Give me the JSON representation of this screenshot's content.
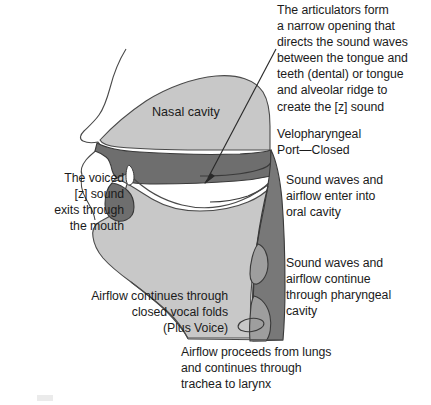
{
  "figure": {
    "background_color": "#ffffff",
    "text_color": "#1b1b1b"
  },
  "colors": {
    "light_gray": "#c8c8c8",
    "mid_gray": "#9e9e9e",
    "dark_gray": "#6e6e6e",
    "pharynx_gray": "#787878",
    "outline": "#3a3a3a",
    "white": "#ffffff"
  },
  "labels": {
    "nasal_cavity": "Nasal cavity"
  },
  "annotations": [
    {
      "id": "articulators",
      "text": "The articulators form\na narrow opening that\ndirects the sound waves\nbetween the tongue and\nteeth (dental) or tongue\nand alveolar ridge to\ncreate the [z] sound",
      "align": "left"
    },
    {
      "id": "velopharyngeal",
      "text": "Velopharyngeal\nPort—Closed",
      "align": "left"
    },
    {
      "id": "oral-cavity",
      "text": "Sound waves and\nairflow enter into\noral cavity",
      "align": "left"
    },
    {
      "id": "pharyngeal-cavity",
      "text": "Sound waves and\nairflow continue\nthrough pharyngeal\ncavity",
      "align": "left"
    },
    {
      "id": "voiced-z",
      "text": "The voiced\n[z] sound\nexits through\nthe mouth",
      "align": "right"
    },
    {
      "id": "vocal-folds",
      "text": "Airflow continues through\nclosed vocal folds\n(Plus Voice)",
      "align": "right"
    },
    {
      "id": "lungs",
      "text": "Airflow proceeds from lungs\nand continues through\ntrachea to larynx",
      "align": "left"
    }
  ],
  "pointer": {
    "name": "articulators-arrow",
    "from": [
      276,
      49
    ],
    "to": [
      205,
      182
    ]
  }
}
